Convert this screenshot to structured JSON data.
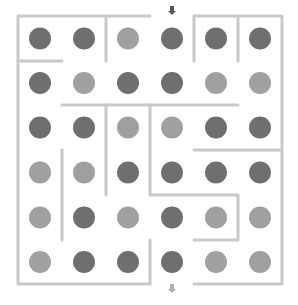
{
  "puzzle": {
    "type": "maze",
    "rows": 6,
    "cols": 6,
    "colors": {
      "dark": "#6f6f6f",
      "light": "#a0a0a0",
      "wall": "#c9c9c9",
      "arrow": "#555555",
      "arrow_exit": "#b0b0b0"
    },
    "grid": [
      [
        "dark",
        "dark",
        "light",
        "dark",
        "dark",
        "dark"
      ],
      [
        "dark",
        "light",
        "dark",
        "dark",
        "light",
        "light"
      ],
      [
        "dark",
        "dark",
        "light",
        "light",
        "dark",
        "dark"
      ],
      [
        "light",
        "light",
        "dark",
        "dark",
        "dark",
        "dark"
      ],
      [
        "light",
        "dark",
        "light",
        "dark",
        "light",
        "light"
      ],
      [
        "light",
        "dark",
        "dark",
        "dark",
        "light",
        "light"
      ]
    ],
    "entrance": {
      "row": 0,
      "col": 3,
      "icon": "down-arrow"
    },
    "exit": {
      "row": 5,
      "col": 3,
      "icon": "down-arrow"
    }
  }
}
